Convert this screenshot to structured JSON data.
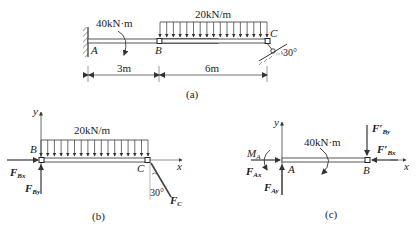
{
  "figure_a": {
    "caption": "(a)",
    "load_label": "20kN/m",
    "moment_label": "40kN·m",
    "points": {
      "A": "A",
      "B": "B",
      "C": "C"
    },
    "angle_label": "30°",
    "dims": {
      "AB": "3m",
      "BC": "6m"
    }
  },
  "figure_b": {
    "caption": "(b)",
    "load_label": "20kN/m",
    "points": {
      "B": "B",
      "C": "C"
    },
    "axes": {
      "x": "x",
      "y": "y"
    },
    "forces": {
      "Bx": "F",
      "Bx_sub": "Bx",
      "By": "F",
      "By_sub": "By",
      "C": "F",
      "C_sub": "C"
    },
    "angle_label": "30°"
  },
  "figure_c": {
    "caption": "(c)",
    "moment_label": "40kN·m",
    "points": {
      "A": "A",
      "B": "B"
    },
    "axes": {
      "x": "x",
      "y": "y"
    },
    "moment_A": "M",
    "moment_A_sub": "A",
    "forces": {
      "Ax": "F",
      "Ax_sub": "Ax",
      "Ay": "F",
      "Ay_sub": "Ay",
      "Bx": "F′",
      "Bx_sub": "Bx",
      "By": "F′",
      "By_sub": "By"
    }
  }
}
